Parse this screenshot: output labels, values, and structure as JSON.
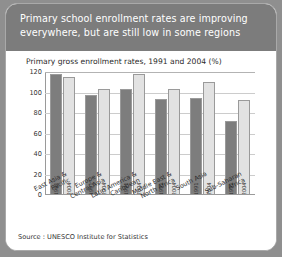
{
  "banner": {
    "title": "Primary school enrollment rates are improving\neverywhere, but are still low in some regions"
  },
  "source": {
    "text": "Source : UNESCO Institute for Statistics"
  },
  "colors": {
    "banner_bg": "#7c7c7c",
    "frame_bg": "#ffffff",
    "page_bg": "#8f8f8f",
    "bar_1991": "#7d7d7d",
    "bar_2004": "#e2e2e2",
    "gridline": "#cccccc",
    "axis": "#9a9a9a"
  },
  "chart_data": {
    "type": "bar",
    "title": "Primary gross enrollment rates, 1991 and 2004 (%)",
    "xlabel": "",
    "ylabel": "",
    "ylim": [
      0,
      120
    ],
    "yticks": [
      0,
      20,
      40,
      60,
      80,
      100,
      120
    ],
    "ytick_labels": [
      "0",
      "20",
      "40",
      "60",
      "80",
      "100",
      "120"
    ],
    "grid": true,
    "legend": "none",
    "categories": [
      "East Asia &\nPacific",
      "Europe &\nCentral Asia",
      "Latin America &\nCaribbean",
      "Middle East &\nNorth Africa",
      "South Asia",
      "Sub-Saharan\nAfrica"
    ],
    "series": [
      {
        "name": "1991",
        "values": [
          118,
          98,
          103,
          94,
          95,
          72
        ]
      },
      {
        "name": "2004",
        "values": [
          115,
          103,
          118,
          103,
          110,
          93
        ]
      }
    ],
    "bar_inline_labels": [
      "1991",
      "2004",
      "1991",
      "2004",
      "1991",
      "2004",
      "1991",
      "2004",
      "1991",
      "2004",
      "1991",
      "2004"
    ]
  }
}
